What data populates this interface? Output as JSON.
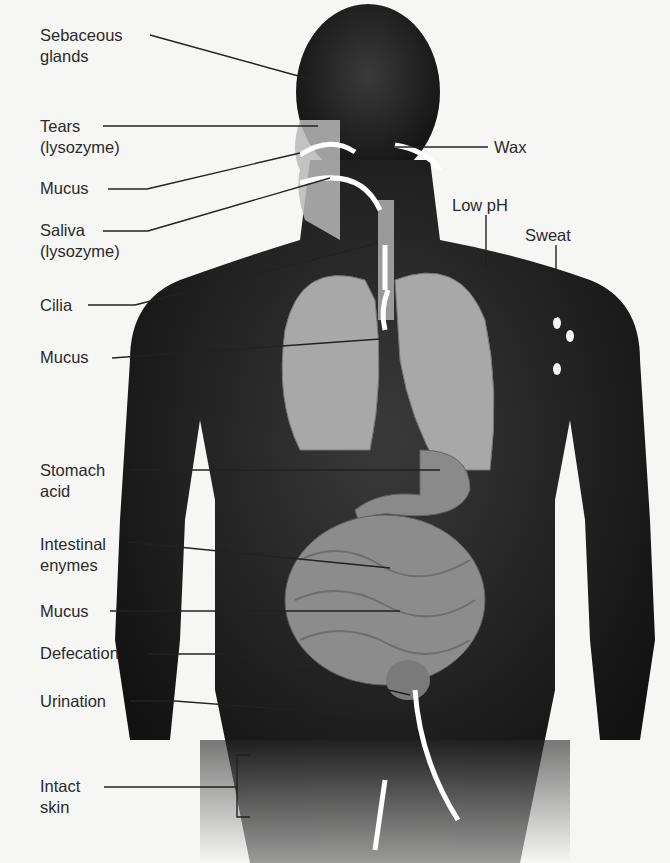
{
  "figure": {
    "colors": {
      "background": "#f6f6f5",
      "body": "#1a1a1a",
      "organs": "#9a9a9a",
      "text": "#2a2a2a",
      "leader": "#222222",
      "arrow": "#ffffff"
    },
    "labels_left": [
      {
        "id": "sebaceous",
        "line1": "Sebaceous",
        "line2": "glands",
        "x": 40,
        "y": 25
      },
      {
        "id": "tears",
        "line1": "Tears",
        "line2": "(lysozyme)",
        "x": 40,
        "y": 116
      },
      {
        "id": "mucus-nose",
        "line1": "Mucus",
        "line2": "",
        "x": 40,
        "y": 178
      },
      {
        "id": "saliva",
        "line1": "Saliva",
        "line2": "(lysozyme)",
        "x": 40,
        "y": 220
      },
      {
        "id": "cilia",
        "line1": "Cilia",
        "line2": "",
        "x": 40,
        "y": 296
      },
      {
        "id": "mucus-lungs",
        "line1": "Mucus",
        "line2": "",
        "x": 40,
        "y": 348
      },
      {
        "id": "stomach",
        "line1": "Stomach",
        "line2": "acid",
        "x": 40,
        "y": 461
      },
      {
        "id": "intestinal",
        "line1": "Intestinal",
        "line2": "enymes",
        "x": 40,
        "y": 535
      },
      {
        "id": "mucus-gut",
        "line1": "Mucus",
        "line2": "",
        "x": 40,
        "y": 603
      },
      {
        "id": "defecation",
        "line1": "Defecation",
        "line2": "",
        "x": 40,
        "y": 645
      },
      {
        "id": "urination",
        "line1": "Urination",
        "line2": "",
        "x": 40,
        "y": 692
      },
      {
        "id": "skin",
        "line1": "Intact",
        "line2": "skin",
        "x": 40,
        "y": 776
      }
    ],
    "labels_right": [
      {
        "id": "wax",
        "text": "Wax",
        "x": 494,
        "y": 138
      },
      {
        "id": "lowph",
        "text": "Low pH",
        "x": 452,
        "y": 196
      },
      {
        "id": "sweat",
        "text": "Sweat",
        "x": 525,
        "y": 226
      }
    ]
  }
}
